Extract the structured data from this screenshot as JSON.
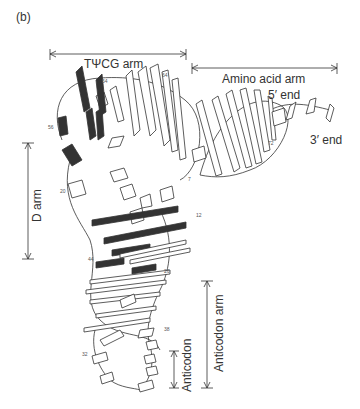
{
  "panel_label": "(b)",
  "labels": {
    "tpsicg_arm": "TΨCG arm",
    "amino_acid_arm": "Amino acid arm",
    "five_prime_end": "5′ end",
    "three_prime_end": "3′ end",
    "d_arm": "D arm",
    "anticodon_arm": "Anticodon arm",
    "anticodon": "Anticodon"
  },
  "residue_numbers": {
    "n54": "54",
    "n64": "64",
    "n56": "56",
    "n72": "72",
    "n7": "7",
    "n20": "20",
    "n12": "12",
    "n44": "44",
    "n26": "26",
    "n38": "38",
    "n32": "32"
  },
  "colors": {
    "line": "#333333",
    "dark_base": "#333333",
    "light_base": "#ffffff"
  }
}
